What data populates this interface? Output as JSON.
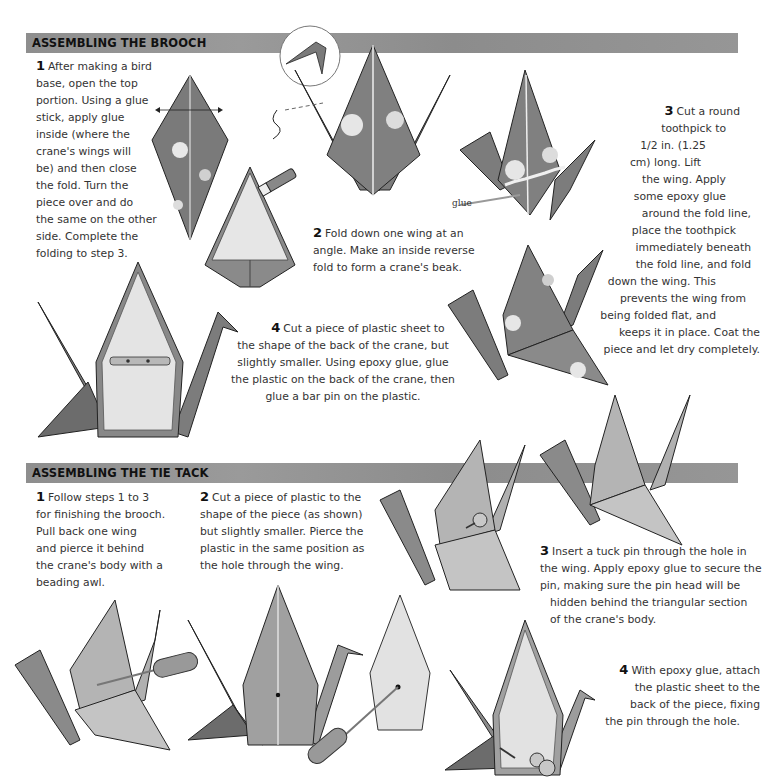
{
  "sections": [
    {
      "title": "ASSEMBLING THE BROOCH",
      "steps": [
        {
          "number": "1",
          "text": [
            "After making a bird",
            "base, open the top",
            "portion. Using a glue",
            "stick, apply glue",
            "inside (where the",
            "crane's wings will",
            "be) and then close",
            "the fold. Turn the",
            "piece over and do",
            "the same on the other",
            "side. Complete the",
            "folding to step 3."
          ]
        },
        {
          "number": "2",
          "text": [
            "Fold down one wing at an",
            "angle. Make an inside reverse",
            "fold to form a crane's beak."
          ]
        },
        {
          "number": "3",
          "text": [
            "Cut a round",
            "toothpick to",
            "1/2 in. (1.25",
            "cm) long. Lift",
            "the wing. Apply",
            "some epoxy glue",
            "around the fold line,",
            "place the toothpick",
            "immediately beneath",
            "the fold line, and fold",
            "down the wing. This",
            "prevents the wing from",
            "being folded flat, and",
            "keeps it in place. Coat the",
            "piece and let dry completely."
          ]
        },
        {
          "number": "4",
          "text": [
            "Cut a piece of plastic sheet to",
            "the shape of the back of the crane, but",
            "slightly smaller. Using epoxy glue, glue",
            "the plastic on the back of the crane, then",
            "glue a bar pin on the plastic."
          ]
        }
      ],
      "labels": {
        "glue": "glue"
      }
    },
    {
      "title": "ASSEMBLING THE TIE TACK",
      "steps": [
        {
          "number": "1",
          "text": [
            "Follow steps 1 to 3",
            "for finishing the brooch.",
            "Pull back one wing",
            "and pierce it behind",
            "the crane's body with a",
            "beading awl."
          ]
        },
        {
          "number": "2",
          "text": [
            "Cut a piece of plastic to the",
            "shape of the piece (as shown)",
            "but slightly smaller. Pierce the",
            "plastic in the same position as",
            "the hole through the wing."
          ]
        },
        {
          "number": "3",
          "text": [
            "Insert a tuck pin through the hole in",
            "the wing. Apply epoxy glue to secure the",
            "pin, making sure the pin head will be",
            "hidden behind the triangular section",
            "of the crane's body."
          ]
        },
        {
          "number": "4",
          "text": [
            "With epoxy glue, attach",
            "the plastic sheet to the",
            "back of the piece, fixing",
            "the pin through the hole."
          ]
        }
      ]
    }
  ],
  "colors": {
    "header_bar": "#939393",
    "paper_dark": "#6f6f6f",
    "paper_light": "#bdbdbd",
    "plastic": "#e6e6e6"
  }
}
